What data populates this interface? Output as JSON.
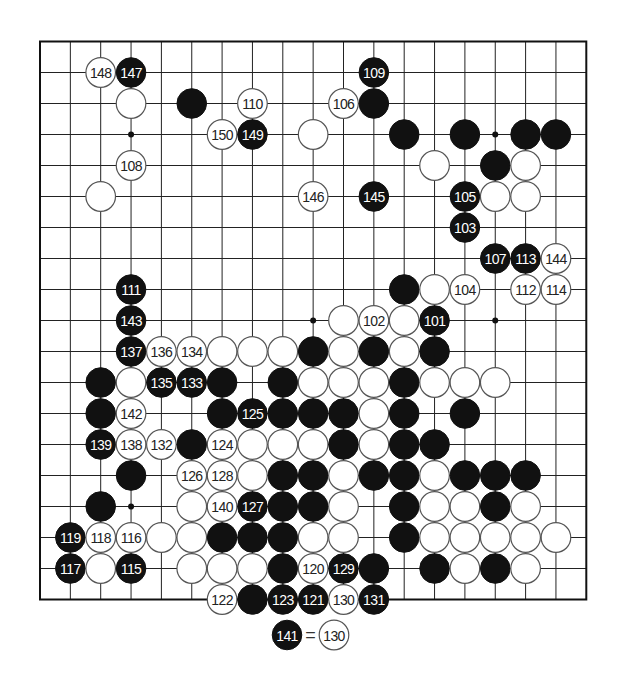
{
  "board": {
    "size": 19,
    "origin": {
      "x": 40,
      "y": 41.5
    },
    "spacing": {
      "x": 30.35,
      "y": 31.0
    },
    "stone_radius": 14.8,
    "colors": {
      "black": "#111111",
      "white": "#ffffff",
      "line": "#222222"
    },
    "hoshi": [
      [
        3,
        3
      ],
      [
        15,
        3
      ],
      [
        9,
        9
      ],
      [
        15,
        9
      ],
      [
        3,
        15
      ]
    ],
    "stones": [
      {
        "col": 2,
        "row": 1,
        "color": "W",
        "label": "148"
      },
      {
        "col": 3,
        "row": 1,
        "color": "B",
        "label": "147"
      },
      {
        "col": 11,
        "row": 1,
        "color": "B",
        "label": "109"
      },
      {
        "col": 3,
        "row": 2,
        "color": "W",
        "label": ""
      },
      {
        "col": 5,
        "row": 2,
        "color": "B",
        "label": ""
      },
      {
        "col": 7,
        "row": 2,
        "color": "W",
        "label": "110"
      },
      {
        "col": 10,
        "row": 2,
        "color": "W",
        "label": "106"
      },
      {
        "col": 11,
        "row": 2,
        "color": "B",
        "label": ""
      },
      {
        "col": 6,
        "row": 3,
        "color": "W",
        "label": "150"
      },
      {
        "col": 7,
        "row": 3,
        "color": "B",
        "label": "149"
      },
      {
        "col": 9,
        "row": 3,
        "color": "W",
        "label": ""
      },
      {
        "col": 12,
        "row": 3,
        "color": "B",
        "label": ""
      },
      {
        "col": 14,
        "row": 3,
        "color": "B",
        "label": ""
      },
      {
        "col": 16,
        "row": 3,
        "color": "B",
        "label": ""
      },
      {
        "col": 17,
        "row": 3,
        "color": "B",
        "label": ""
      },
      {
        "col": 3,
        "row": 4,
        "color": "W",
        "label": "108"
      },
      {
        "col": 13,
        "row": 4,
        "color": "W",
        "label": ""
      },
      {
        "col": 15,
        "row": 4,
        "color": "B",
        "label": ""
      },
      {
        "col": 16,
        "row": 4,
        "color": "W",
        "label": ""
      },
      {
        "col": 2,
        "row": 5,
        "color": "W",
        "label": ""
      },
      {
        "col": 9,
        "row": 5,
        "color": "W",
        "label": "146"
      },
      {
        "col": 11,
        "row": 5,
        "color": "B",
        "label": "145"
      },
      {
        "col": 14,
        "row": 5,
        "color": "B",
        "label": "105"
      },
      {
        "col": 15,
        "row": 5,
        "color": "W",
        "label": ""
      },
      {
        "col": 16,
        "row": 5,
        "color": "W",
        "label": ""
      },
      {
        "col": 14,
        "row": 6,
        "color": "B",
        "label": "103"
      },
      {
        "col": 15,
        "row": 7,
        "color": "B",
        "label": "107"
      },
      {
        "col": 16,
        "row": 7,
        "color": "B",
        "label": "113"
      },
      {
        "col": 17,
        "row": 7,
        "color": "W",
        "label": "144"
      },
      {
        "col": 3,
        "row": 8,
        "color": "B",
        "label": "111"
      },
      {
        "col": 12,
        "row": 8,
        "color": "B",
        "label": ""
      },
      {
        "col": 13,
        "row": 8,
        "color": "W",
        "label": ""
      },
      {
        "col": 14,
        "row": 8,
        "color": "W",
        "label": "104"
      },
      {
        "col": 16,
        "row": 8,
        "color": "W",
        "label": "112"
      },
      {
        "col": 17,
        "row": 8,
        "color": "W",
        "label": "114"
      },
      {
        "col": 3,
        "row": 9,
        "color": "B",
        "label": "143"
      },
      {
        "col": 10,
        "row": 9,
        "color": "W",
        "label": ""
      },
      {
        "col": 11,
        "row": 9,
        "color": "W",
        "label": "102"
      },
      {
        "col": 12,
        "row": 9,
        "color": "W",
        "label": ""
      },
      {
        "col": 13,
        "row": 9,
        "color": "B",
        "label": "101"
      },
      {
        "col": 3,
        "row": 10,
        "color": "B",
        "label": "137"
      },
      {
        "col": 4,
        "row": 10,
        "color": "W",
        "label": "136"
      },
      {
        "col": 5,
        "row": 10,
        "color": "W",
        "label": "134"
      },
      {
        "col": 6,
        "row": 10,
        "color": "W",
        "label": ""
      },
      {
        "col": 7,
        "row": 10,
        "color": "W",
        "label": ""
      },
      {
        "col": 8,
        "row": 10,
        "color": "W",
        "label": ""
      },
      {
        "col": 9,
        "row": 10,
        "color": "B",
        "label": ""
      },
      {
        "col": 10,
        "row": 10,
        "color": "W",
        "label": ""
      },
      {
        "col": 11,
        "row": 10,
        "color": "B",
        "label": ""
      },
      {
        "col": 12,
        "row": 10,
        "color": "W",
        "label": ""
      },
      {
        "col": 13,
        "row": 10,
        "color": "B",
        "label": ""
      },
      {
        "col": 2,
        "row": 11,
        "color": "B",
        "label": ""
      },
      {
        "col": 3,
        "row": 11,
        "color": "W",
        "label": ""
      },
      {
        "col": 4,
        "row": 11,
        "color": "B",
        "label": "135"
      },
      {
        "col": 5,
        "row": 11,
        "color": "B",
        "label": "133"
      },
      {
        "col": 6,
        "row": 11,
        "color": "B",
        "label": ""
      },
      {
        "col": 8,
        "row": 11,
        "color": "B",
        "label": ""
      },
      {
        "col": 9,
        "row": 11,
        "color": "W",
        "label": ""
      },
      {
        "col": 10,
        "row": 11,
        "color": "W",
        "label": ""
      },
      {
        "col": 11,
        "row": 11,
        "color": "W",
        "label": ""
      },
      {
        "col": 12,
        "row": 11,
        "color": "B",
        "label": ""
      },
      {
        "col": 13,
        "row": 11,
        "color": "W",
        "label": ""
      },
      {
        "col": 14,
        "row": 11,
        "color": "W",
        "label": ""
      },
      {
        "col": 15,
        "row": 11,
        "color": "W",
        "label": ""
      },
      {
        "col": 2,
        "row": 12,
        "color": "B",
        "label": ""
      },
      {
        "col": 3,
        "row": 12,
        "color": "W",
        "label": "142"
      },
      {
        "col": 6,
        "row": 12,
        "color": "B",
        "label": ""
      },
      {
        "col": 7,
        "row": 12,
        "color": "B",
        "label": "125"
      },
      {
        "col": 8,
        "row": 12,
        "color": "B",
        "label": ""
      },
      {
        "col": 9,
        "row": 12,
        "color": "B",
        "label": ""
      },
      {
        "col": 10,
        "row": 12,
        "color": "B",
        "label": ""
      },
      {
        "col": 11,
        "row": 12,
        "color": "W",
        "label": ""
      },
      {
        "col": 12,
        "row": 12,
        "color": "B",
        "label": ""
      },
      {
        "col": 14,
        "row": 12,
        "color": "B",
        "label": ""
      },
      {
        "col": 2,
        "row": 13,
        "color": "B",
        "label": "139"
      },
      {
        "col": 3,
        "row": 13,
        "color": "W",
        "label": "138"
      },
      {
        "col": 4,
        "row": 13,
        "color": "W",
        "label": "132"
      },
      {
        "col": 5,
        "row": 13,
        "color": "B",
        "label": ""
      },
      {
        "col": 6,
        "row": 13,
        "color": "W",
        "label": "124"
      },
      {
        "col": 7,
        "row": 13,
        "color": "W",
        "label": ""
      },
      {
        "col": 8,
        "row": 13,
        "color": "W",
        "label": ""
      },
      {
        "col": 9,
        "row": 13,
        "color": "W",
        "label": ""
      },
      {
        "col": 10,
        "row": 13,
        "color": "B",
        "label": ""
      },
      {
        "col": 11,
        "row": 13,
        "color": "W",
        "label": ""
      },
      {
        "col": 12,
        "row": 13,
        "color": "B",
        "label": ""
      },
      {
        "col": 13,
        "row": 13,
        "color": "B",
        "label": ""
      },
      {
        "col": 3,
        "row": 14,
        "color": "B",
        "label": ""
      },
      {
        "col": 5,
        "row": 14,
        "color": "W",
        "label": "126"
      },
      {
        "col": 6,
        "row": 14,
        "color": "W",
        "label": "128"
      },
      {
        "col": 7,
        "row": 14,
        "color": "W",
        "label": ""
      },
      {
        "col": 8,
        "row": 14,
        "color": "B",
        "label": ""
      },
      {
        "col": 9,
        "row": 14,
        "color": "B",
        "label": ""
      },
      {
        "col": 10,
        "row": 14,
        "color": "W",
        "label": ""
      },
      {
        "col": 11,
        "row": 14,
        "color": "B",
        "label": ""
      },
      {
        "col": 12,
        "row": 14,
        "color": "B",
        "label": ""
      },
      {
        "col": 13,
        "row": 14,
        "color": "W",
        "label": ""
      },
      {
        "col": 14,
        "row": 14,
        "color": "B",
        "label": ""
      },
      {
        "col": 15,
        "row": 14,
        "color": "B",
        "label": ""
      },
      {
        "col": 16,
        "row": 14,
        "color": "B",
        "label": ""
      },
      {
        "col": 2,
        "row": 15,
        "color": "B",
        "label": ""
      },
      {
        "col": 5,
        "row": 15,
        "color": "W",
        "label": ""
      },
      {
        "col": 6,
        "row": 15,
        "color": "W",
        "label": "140"
      },
      {
        "col": 7,
        "row": 15,
        "color": "B",
        "label": "127"
      },
      {
        "col": 8,
        "row": 15,
        "color": "B",
        "label": ""
      },
      {
        "col": 9,
        "row": 15,
        "color": "B",
        "label": ""
      },
      {
        "col": 10,
        "row": 15,
        "color": "W",
        "label": ""
      },
      {
        "col": 12,
        "row": 15,
        "color": "B",
        "label": ""
      },
      {
        "col": 13,
        "row": 15,
        "color": "W",
        "label": ""
      },
      {
        "col": 14,
        "row": 15,
        "color": "W",
        "label": ""
      },
      {
        "col": 15,
        "row": 15,
        "color": "B",
        "label": ""
      },
      {
        "col": 16,
        "row": 15,
        "color": "W",
        "label": ""
      },
      {
        "col": 1,
        "row": 16,
        "color": "B",
        "label": "119"
      },
      {
        "col": 2,
        "row": 16,
        "color": "W",
        "label": "118"
      },
      {
        "col": 3,
        "row": 16,
        "color": "W",
        "label": "116"
      },
      {
        "col": 4,
        "row": 16,
        "color": "W",
        "label": ""
      },
      {
        "col": 5,
        "row": 16,
        "color": "W",
        "label": ""
      },
      {
        "col": 6,
        "row": 16,
        "color": "B",
        "label": ""
      },
      {
        "col": 7,
        "row": 16,
        "color": "B",
        "label": ""
      },
      {
        "col": 8,
        "row": 16,
        "color": "B",
        "label": ""
      },
      {
        "col": 9,
        "row": 16,
        "color": "W",
        "label": ""
      },
      {
        "col": 10,
        "row": 16,
        "color": "W",
        "label": ""
      },
      {
        "col": 12,
        "row": 16,
        "color": "B",
        "label": ""
      },
      {
        "col": 13,
        "row": 16,
        "color": "W",
        "label": ""
      },
      {
        "col": 14,
        "row": 16,
        "color": "W",
        "label": ""
      },
      {
        "col": 15,
        "row": 16,
        "color": "W",
        "label": ""
      },
      {
        "col": 16,
        "row": 16,
        "color": "W",
        "label": ""
      },
      {
        "col": 17,
        "row": 16,
        "color": "W",
        "label": ""
      },
      {
        "col": 1,
        "row": 17,
        "color": "B",
        "label": "117"
      },
      {
        "col": 2,
        "row": 17,
        "color": "W",
        "label": ""
      },
      {
        "col": 3,
        "row": 17,
        "color": "B",
        "label": "115"
      },
      {
        "col": 5,
        "row": 17,
        "color": "W",
        "label": ""
      },
      {
        "col": 6,
        "row": 17,
        "color": "W",
        "label": ""
      },
      {
        "col": 7,
        "row": 17,
        "color": "W",
        "label": ""
      },
      {
        "col": 8,
        "row": 17,
        "color": "B",
        "label": ""
      },
      {
        "col": 9,
        "row": 17,
        "color": "W",
        "label": "120"
      },
      {
        "col": 10,
        "row": 17,
        "color": "B",
        "label": "129"
      },
      {
        "col": 11,
        "row": 17,
        "color": "B",
        "label": ""
      },
      {
        "col": 13,
        "row": 17,
        "color": "B",
        "label": ""
      },
      {
        "col": 14,
        "row": 17,
        "color": "W",
        "label": ""
      },
      {
        "col": 15,
        "row": 17,
        "color": "B",
        "label": ""
      },
      {
        "col": 16,
        "row": 17,
        "color": "W",
        "label": ""
      },
      {
        "col": 6,
        "row": 18,
        "color": "W",
        "label": "122"
      },
      {
        "col": 7,
        "row": 18,
        "color": "B",
        "label": ""
      },
      {
        "col": 8,
        "row": 18,
        "color": "B",
        "label": "123"
      },
      {
        "col": 9,
        "row": 18,
        "color": "B",
        "label": "121"
      },
      {
        "col": 10,
        "row": 18,
        "color": "W",
        "label": "130"
      },
      {
        "col": 11,
        "row": 18,
        "color": "B",
        "label": "131"
      }
    ]
  },
  "footnote": {
    "left": {
      "color": "B",
      "label": "141",
      "x": 287,
      "y": 635
    },
    "equals": "=",
    "right": {
      "color": "W",
      "label": "130",
      "x": 334,
      "y": 635
    }
  }
}
